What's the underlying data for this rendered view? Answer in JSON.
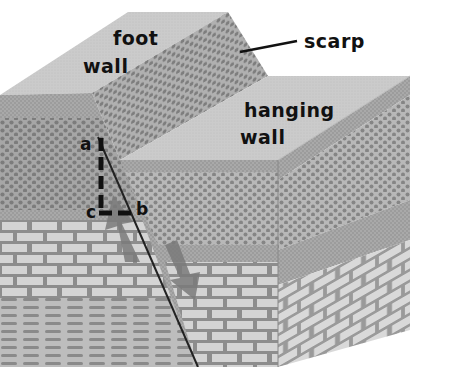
{
  "diagram": {
    "labels": {
      "foot_wall_line1": "foot",
      "foot_wall_line2": "wall",
      "hanging_wall_line1": "hanging",
      "hanging_wall_line2": "wall",
      "scarp": "scarp",
      "point_a": "a",
      "point_b": "b",
      "point_c": "c"
    },
    "components": [
      "foot wall block",
      "hanging wall block",
      "fault scarp",
      "fault plane line",
      "upward arrow (foot wall relative motion)",
      "downward arrow (hanging wall relative motion)",
      "dashed displacement lines a-c and c-b"
    ],
    "layers": [
      "top soil",
      "dotted sandstone",
      "fine laminated layer",
      "brick limestone",
      "wavy shale"
    ],
    "colors": {
      "top_face": "#cfcfcf",
      "front_face": "#9c9c9c",
      "right_face": "#b4b4b4",
      "dots": "#7d7d7d",
      "brick": "#d8d8d8",
      "mortar": "#8a8a8a",
      "arrow": "#7a7a7a",
      "fault_line": "#222222",
      "text": "#111111"
    }
  }
}
